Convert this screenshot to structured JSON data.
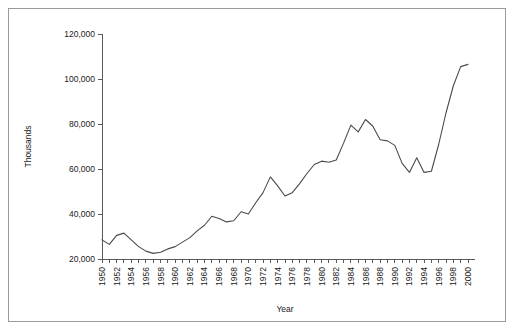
{
  "chart_data": {
    "type": "line",
    "title": "",
    "xlabel": "Year",
    "ylabel": "Thousands",
    "xlim": [
      1950,
      2000
    ],
    "ylim": [
      20000,
      120000
    ],
    "ytick_values": [
      20000,
      40000,
      60000,
      80000,
      100000,
      120000
    ],
    "ytick_labels": [
      "20,000",
      "40,000",
      "60,000",
      "80,000",
      "100,000",
      "120,000"
    ],
    "xtick_labels": [
      "1950",
      "1952",
      "1954",
      "1956",
      "1958",
      "1960",
      "1962",
      "1964",
      "1966",
      "1968",
      "1970",
      "1972",
      "1974",
      "1976",
      "1978",
      "1980",
      "1982",
      "1984",
      "1986",
      "1988",
      "1990",
      "1992",
      "1994",
      "1996",
      "1998",
      "2000"
    ],
    "xtick_label_rotation": -90,
    "xtick_interval_years": 2,
    "minor_tick_interval_years": 1,
    "grid": false,
    "legend": false,
    "line_color": "#4a4a4a",
    "border_color": "#9a9a9a",
    "x": [
      1950,
      1951,
      1952,
      1953,
      1954,
      1955,
      1956,
      1957,
      1958,
      1959,
      1960,
      1961,
      1962,
      1963,
      1964,
      1965,
      1966,
      1967,
      1968,
      1969,
      1970,
      1971,
      1972,
      1973,
      1974,
      1975,
      1976,
      1977,
      1978,
      1979,
      1980,
      1981,
      1982,
      1983,
      1984,
      1985,
      1986,
      1987,
      1988,
      1989,
      1990,
      1991,
      1992,
      1993,
      1994,
      1995,
      1996,
      1997,
      1998,
      1999,
      2000
    ],
    "values": [
      28500,
      26500,
      30500,
      31500,
      28500,
      25500,
      23500,
      22500,
      23000,
      24500,
      25500,
      27500,
      29500,
      32500,
      35000,
      39000,
      38000,
      36500,
      37000,
      41000,
      40000,
      45000,
      49500,
      56500,
      52500,
      48000,
      49500,
      53500,
      58000,
      62000,
      63500,
      63000,
      64000,
      71500,
      79500,
      76500,
      82000,
      79000,
      73000,
      72500,
      70500,
      62500,
      58500,
      65000,
      58500,
      59000,
      71000,
      85000,
      97000,
      105500,
      106500
    ]
  }
}
